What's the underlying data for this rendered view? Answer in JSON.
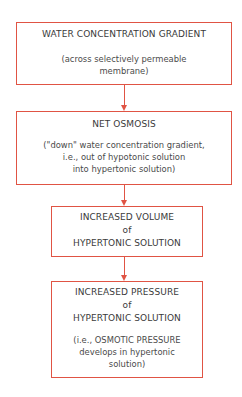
{
  "diagram": {
    "type": "flowchart",
    "direction": "top-to-bottom",
    "colors": {
      "border": "#e05444",
      "arrow": "#e05444",
      "text": "#3a3a3a",
      "background": "#ffffff"
    },
    "nodes": [
      {
        "id": "water-concentration-gradient",
        "title": "WATER CONCENTRATION  GRADIENT",
        "note": "(across selectively permeable\nmembrane)"
      },
      {
        "id": "net-osmosis",
        "title": "NET  OSMOSIS",
        "note": "(\"down\" water concentration gradient,\ni.e., out of hypotonic solution\ninto hypertonic solution)"
      },
      {
        "id": "increased-volume",
        "title": "INCREASED  VOLUME\nof\nHYPERTONIC  SOLUTION",
        "note": ""
      },
      {
        "id": "increased-pressure",
        "title": "INCREASED  PRESSURE\nof\nHYPERTONIC  SOLUTION",
        "note": "(i.e., OSMOTIC PRESSURE\ndevelops in hypertonic\nsolution)"
      }
    ],
    "edges": [
      {
        "from": "water-concentration-gradient",
        "to": "net-osmosis"
      },
      {
        "from": "net-osmosis",
        "to": "increased-volume"
      },
      {
        "from": "increased-volume",
        "to": "increased-pressure"
      }
    ]
  }
}
